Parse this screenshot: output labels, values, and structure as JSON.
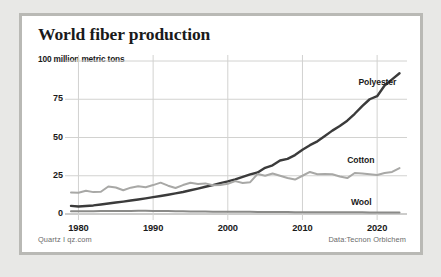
{
  "card": {
    "title": "World fiber production",
    "unit_label": "100 million metric tons",
    "credit_left": "Quartz I qz.com",
    "credit_right": "Data:Tecnon Orbichem",
    "border_color": "#b9b9b5",
    "background_color": "#ffffff",
    "page_background": "#e8e8e6"
  },
  "chart_data": {
    "type": "line",
    "title": "World fiber production",
    "xlabel": "",
    "ylabel": "100 million metric tons",
    "ylim": [
      0,
      100
    ],
    "xlim": [
      1979,
      2024
    ],
    "yticks": [
      0,
      25,
      50,
      75,
      100
    ],
    "ytick_labels": [
      "0",
      "25",
      "50",
      "75",
      "100 million metric tons"
    ],
    "xticks": [
      1980,
      1990,
      2000,
      2010,
      2020
    ],
    "xtick_labels": [
      "1980",
      "1990",
      "2000",
      "2010",
      "2020"
    ],
    "grid": true,
    "legend": "inline-labels-right",
    "x": [
      1979,
      1980,
      1981,
      1982,
      1983,
      1984,
      1985,
      1986,
      1987,
      1988,
      1989,
      1990,
      1991,
      1992,
      1993,
      1994,
      1995,
      1996,
      1997,
      1998,
      1999,
      2000,
      2001,
      2002,
      2003,
      2004,
      2005,
      2006,
      2007,
      2008,
      2009,
      2010,
      2011,
      2012,
      2013,
      2014,
      2015,
      2016,
      2017,
      2018,
      2019,
      2020,
      2021,
      2022,
      2023
    ],
    "series": [
      {
        "name": "Polyester",
        "color": "#3b3b3b",
        "width": 2.4,
        "values": [
          5.3,
          4.9,
          5.2,
          5.6,
          6.2,
          6.9,
          7.5,
          8.1,
          8.8,
          9.5,
          10.2,
          11.0,
          11.8,
          12.6,
          13.5,
          14.4,
          15.5,
          16.6,
          17.8,
          18.9,
          20.2,
          21.3,
          22.6,
          24.3,
          25.9,
          27.1,
          30.2,
          31.8,
          35.0,
          36.0,
          38.5,
          42.0,
          45.0,
          47.5,
          51.0,
          54.5,
          57.5,
          61.0,
          65.5,
          70.5,
          75.0,
          77.0,
          84.0,
          88.0,
          92.0
        ]
      },
      {
        "name": "Cotton",
        "color": "#a8a8a6",
        "width": 2.0,
        "values": [
          14.0,
          13.9,
          15.2,
          14.3,
          14.5,
          18.0,
          17.3,
          15.5,
          17.2,
          18.2,
          17.5,
          18.9,
          20.5,
          18.5,
          17.0,
          18.9,
          20.4,
          19.6,
          20.0,
          18.8,
          19.0,
          19.8,
          21.5,
          20.3,
          20.8,
          26.2,
          25.0,
          26.5,
          25.0,
          23.5,
          22.5,
          25.0,
          27.5,
          26.0,
          26.2,
          26.0,
          24.5,
          23.5,
          26.8,
          26.5,
          26.0,
          25.5,
          26.8,
          27.5,
          30.0
        ]
      },
      {
        "name": "Wool",
        "color": "#8a8a88",
        "width": 2.0,
        "values": [
          1.8,
          1.8,
          1.85,
          1.85,
          1.9,
          1.9,
          1.95,
          2.0,
          2.0,
          2.05,
          2.05,
          2.0,
          1.95,
          1.9,
          1.8,
          1.75,
          1.7,
          1.65,
          1.6,
          1.55,
          1.5,
          1.5,
          1.45,
          1.4,
          1.4,
          1.35,
          1.3,
          1.3,
          1.3,
          1.25,
          1.2,
          1.2,
          1.2,
          1.15,
          1.15,
          1.15,
          1.1,
          1.1,
          1.1,
          1.1,
          1.05,
          1.0,
          1.0,
          1.0,
          1.0
        ]
      }
    ],
    "annotations": [
      {
        "text": "Polyester",
        "x": 2017.5,
        "y": 86
      },
      {
        "text": "Cotton",
        "x": 2016.0,
        "y": 35
      },
      {
        "text": "Wool",
        "x": 2016.5,
        "y": 8
      }
    ]
  },
  "axes": {
    "y_labels": [
      {
        "text": "75",
        "value": 75
      },
      {
        "text": "50",
        "value": 50
      },
      {
        "text": "25",
        "value": 25
      },
      {
        "text": "0",
        "value": 0
      }
    ],
    "x_labels": [
      {
        "text": "1980",
        "value": 1980
      },
      {
        "text": "1990",
        "value": 1990
      },
      {
        "text": "2000",
        "value": 2000
      },
      {
        "text": "2010",
        "value": 2010
      },
      {
        "text": "2020",
        "value": 2020
      }
    ]
  }
}
